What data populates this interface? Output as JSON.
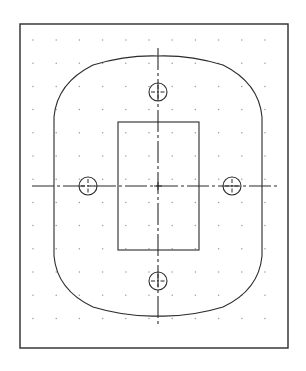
{
  "document": {
    "title": "Orthographic Part View",
    "background_color": "#ffffff",
    "line_color": "#2b2b2b",
    "grid_dot_color": "#9a9a9a",
    "centerline_color": "#2b2b2b",
    "width": 306,
    "height": 371
  },
  "border_frame": {
    "name": "drawing-border",
    "x": 20,
    "y": 24,
    "width": 268,
    "height": 324,
    "stroke_width": 1.4
  },
  "grid": {
    "name": "snap-grid",
    "origin_x": 33,
    "origin_y": 40,
    "spacing": 23.2,
    "columns": 11,
    "rows": 13,
    "dot_radius": 0.75
  },
  "geometry": {
    "outer_profile": {
      "name": "outer-part-outline",
      "description": "rounded octagon plate profile",
      "left_x": 54,
      "right_x": 262,
      "top_y": 56,
      "bottom_y": 316,
      "corner_start_y": 117,
      "corner_end_y": 256,
      "stroke_width": 1.1,
      "path": "M 54 117 Q 57 83 93 65 Q 126 55 158 56 Q 190 55 223 65 Q 259 83 262 117 L 262 256 Q 259 290 223 307 Q 190 317 158 316 Q 126 317 93 307 Q 57 290 54 256 Z"
    },
    "inner_rectangle": {
      "name": "inner-pocket-rectangle",
      "x": 118,
      "y": 122,
      "width": 81,
      "height": 128,
      "stroke_width": 1.1
    },
    "holes": [
      {
        "name": "hole-north",
        "cx": 158,
        "cy": 92,
        "r": 9,
        "mark_len": 14
      },
      {
        "name": "hole-south",
        "cx": 158,
        "cy": 281,
        "r": 9,
        "mark_len": 14
      },
      {
        "name": "hole-west",
        "cx": 88,
        "cy": 186,
        "r": 9,
        "mark_len": 14
      },
      {
        "name": "hole-east",
        "cx": 232,
        "cy": 186,
        "r": 9,
        "mark_len": 14
      }
    ],
    "center_point": {
      "name": "part-center",
      "cx": 158,
      "cy": 186
    }
  },
  "centerlines": {
    "horizontal": {
      "name": "horizontal-centerline",
      "x1": 32,
      "x2": 278,
      "y": 186,
      "dash_pattern": "22 3 3 3",
      "stroke_width": 1.1
    },
    "vertical": {
      "name": "vertical-centerline",
      "x": 158,
      "y1": 48,
      "y2": 325,
      "dash_pattern": "22 3 3 3",
      "stroke_width": 1.1
    }
  }
}
